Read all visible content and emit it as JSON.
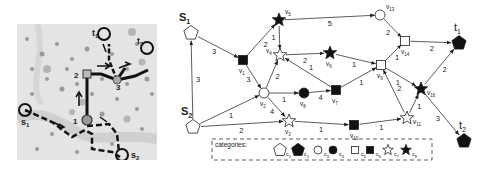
{
  "map": {
    "labels": {
      "s1": "s",
      "s1_sub": "1",
      "s2": "s",
      "s2_sub": "2",
      "t1": "t",
      "t1_sub": "1",
      "t2": "t",
      "t2_sub": "2",
      "p1": "1",
      "p2": "2",
      "p3": "3"
    }
  },
  "graph": {
    "nodes": [
      {
        "id": "s1",
        "label": "S",
        "sub": "1",
        "category": "c1",
        "x": 191,
        "y": 33
      },
      {
        "id": "s2",
        "label": "S",
        "sub": "2",
        "category": "c1",
        "x": 193,
        "y": 127
      },
      {
        "id": "v1",
        "label": "v",
        "sub": "1",
        "category": "c6",
        "x": 243,
        "y": 60
      },
      {
        "id": "v2",
        "label": "v",
        "sub": "2",
        "category": "c3",
        "x": 264,
        "y": 93
      },
      {
        "id": "v3",
        "label": "v",
        "sub": "3",
        "category": "c7",
        "x": 289,
        "y": 121
      },
      {
        "id": "v4",
        "label": "v",
        "sub": "4",
        "category": "c7",
        "x": 280,
        "y": 55
      },
      {
        "id": "v5",
        "label": "v",
        "sub": "5",
        "category": "c8",
        "x": 279,
        "y": 20
      },
      {
        "id": "v6",
        "label": "v",
        "sub": "6",
        "category": "c8",
        "x": 330,
        "y": 53
      },
      {
        "id": "v7",
        "label": "v",
        "sub": "7",
        "category": "c6",
        "x": 336,
        "y": 90
      },
      {
        "id": "v8",
        "label": "v",
        "sub": "8",
        "category": "c4",
        "x": 304,
        "y": 93
      },
      {
        "id": "v9",
        "label": "v",
        "sub": "9",
        "category": "c5",
        "x": 381,
        "y": 65
      },
      {
        "id": "v10",
        "label": "v",
        "sub": "10",
        "category": "c6",
        "x": 354,
        "y": 125
      },
      {
        "id": "v11",
        "label": "v",
        "sub": "11",
        "category": "c7",
        "x": 407,
        "y": 118
      },
      {
        "id": "v13",
        "label": "v",
        "sub": "13",
        "category": "c3",
        "x": 380,
        "y": 15
      },
      {
        "id": "v14",
        "label": "v",
        "sub": "14",
        "category": "c5",
        "x": 405,
        "y": 41
      },
      {
        "id": "v16",
        "label": "v",
        "sub": "16",
        "category": "c8",
        "x": 421,
        "y": 89
      },
      {
        "id": "t1",
        "label": "t",
        "sub": "1",
        "category": "c2",
        "x": 459,
        "y": 43
      },
      {
        "id": "t2",
        "label": "t",
        "sub": "2",
        "category": "c2",
        "x": 464,
        "y": 141
      }
    ],
    "edges": [
      {
        "from": "s1",
        "to": "v1",
        "weight": "3"
      },
      {
        "from": "s2",
        "to": "s1",
        "weight": "3"
      },
      {
        "from": "s2",
        "to": "v2",
        "weight": "1"
      },
      {
        "from": "s2",
        "to": "v3",
        "weight": "2"
      },
      {
        "from": "v1",
        "to": "v5",
        "weight": "2"
      },
      {
        "from": "v1",
        "to": "v2",
        "weight": "3"
      },
      {
        "from": "v5",
        "to": "v4",
        "weight": "1"
      },
      {
        "from": "v5",
        "to": "v13",
        "weight": "5"
      },
      {
        "from": "v4",
        "to": "v6",
        "weight": "2"
      },
      {
        "from": "v2",
        "to": "v4",
        "weight": "2"
      },
      {
        "from": "v2",
        "to": "v8",
        "weight": "1"
      },
      {
        "from": "v2",
        "to": "v3",
        "weight": "4"
      },
      {
        "from": "v8",
        "to": "v7",
        "weight": "4"
      },
      {
        "from": "v7",
        "to": "v4",
        "weight": "1"
      },
      {
        "from": "v7",
        "to": "v9",
        "weight": "1"
      },
      {
        "from": "v6",
        "to": "v9",
        "weight": "1"
      },
      {
        "from": "v3",
        "to": "v10",
        "weight": "1"
      },
      {
        "from": "v10",
        "to": "v11",
        "weight": "1"
      },
      {
        "from": "v11",
        "to": "v9",
        "weight": "2"
      },
      {
        "from": "v11",
        "to": "v16",
        "weight": "1"
      },
      {
        "from": "v9",
        "to": "v14",
        "weight": "1"
      },
      {
        "from": "v9",
        "to": "v16",
        "weight": "1"
      },
      {
        "from": "v13",
        "to": "v14",
        "weight": "2"
      },
      {
        "from": "v14",
        "to": "t1",
        "weight": "2"
      },
      {
        "from": "v16",
        "to": "t1",
        "weight": "2"
      },
      {
        "from": "v16",
        "to": "t2",
        "weight": "3"
      }
    ]
  },
  "legend": {
    "title": "categories:",
    "items": [
      {
        "id": "c1",
        "label": "c",
        "sub": "1",
        "shape": "pentagon-outline"
      },
      {
        "id": "c2",
        "label": "c",
        "sub": "2",
        "shape": "pentagon-filled"
      },
      {
        "id": "c3",
        "label": "c",
        "sub": "3",
        "shape": "circle-outline"
      },
      {
        "id": "c4",
        "label": "c",
        "sub": "4",
        "shape": "circle-filled"
      },
      {
        "id": "c5",
        "label": "c",
        "sub": "5",
        "shape": "square-outline"
      },
      {
        "id": "c6",
        "label": "c",
        "sub": "6",
        "shape": "square-filled"
      },
      {
        "id": "c7",
        "label": "c",
        "sub": "7",
        "shape": "star-outline"
      },
      {
        "id": "c8",
        "label": "c",
        "sub": "8",
        "shape": "star-filled"
      }
    ]
  }
}
